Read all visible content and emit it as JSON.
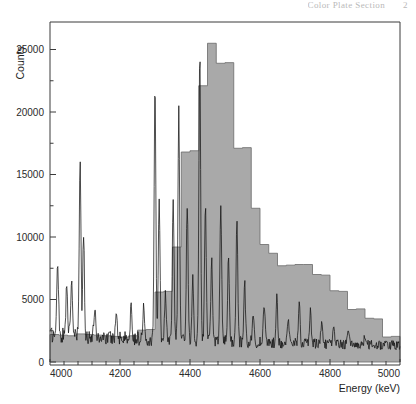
{
  "header": {
    "running_head": "Color Plate Section",
    "page_number": "2"
  },
  "chart_data": {
    "type": "line",
    "title": "",
    "subtitle": "",
    "xlabel": "Energy (keV)",
    "ylabel": "Counts",
    "xlim": [
      4000,
      5000
    ],
    "ylim": [
      0,
      27200
    ],
    "grid": false,
    "legend": null,
    "x_ticks": [
      4000,
      4200,
      4400,
      4600,
      4800,
      5000
    ],
    "x_tick_labels": [
      "4000",
      "4200",
      "4400",
      "4600",
      "4800",
      "5000"
    ],
    "x_minor_tick_step": 40,
    "y_ticks": [
      0,
      5000,
      10000,
      15000,
      20000,
      25000
    ],
    "y_tick_labels": [
      "0",
      "5000",
      "10000",
      "15000",
      "20000",
      "25000"
    ],
    "y_minor_tick_step": 2500,
    "colors": {
      "histogram_fill": "#a9a9a9",
      "histogram_edge": "#6a6a6a",
      "spectrum_line": "#141414",
      "axis": "#3a3a3a"
    },
    "series": [
      {
        "name": "Gated yield (filled histogram)",
        "type": "step",
        "bin_width": 25,
        "bin_edges": [
          4000,
          4025,
          4050,
          4075,
          4100,
          4125,
          4150,
          4175,
          4200,
          4225,
          4250,
          4275,
          4300,
          4325,
          4350,
          4375,
          4400,
          4425,
          4450,
          4475,
          4500,
          4525,
          4550,
          4575,
          4600,
          4625,
          4650,
          4675,
          4700,
          4725,
          4750,
          4775,
          4800,
          4825,
          4850,
          4875,
          4900,
          4925,
          4950,
          4975,
          5000
        ],
        "values": [
          2200,
          2150,
          2100,
          2250,
          2200,
          2150,
          2100,
          2050,
          2000,
          2100,
          2550,
          2600,
          5600,
          5650,
          9200,
          16800,
          16900,
          22100,
          25500,
          23900,
          23950,
          17100,
          17150,
          12300,
          9400,
          8700,
          7700,
          7750,
          7800,
          7800,
          7000,
          6950,
          5700,
          5650,
          4200,
          4250,
          3500,
          3450,
          2000,
          2050
        ]
      },
      {
        "name": "Total spectrum (overlaid line)",
        "type": "line",
        "description": "noisy continuum near 1500-2500 counts with sharp discrete peaks",
        "peaks": [
          {
            "energy": 4022,
            "height": 7700
          },
          {
            "energy": 4048,
            "height": 6100
          },
          {
            "energy": 4062,
            "height": 5900
          },
          {
            "energy": 4086,
            "height": 15700
          },
          {
            "energy": 4096,
            "height": 9500
          },
          {
            "energy": 4128,
            "height": 4100
          },
          {
            "energy": 4190,
            "height": 3900
          },
          {
            "energy": 4232,
            "height": 4200
          },
          {
            "energy": 4268,
            "height": 4400
          },
          {
            "energy": 4300,
            "height": 21900
          },
          {
            "energy": 4312,
            "height": 12800
          },
          {
            "energy": 4330,
            "height": 5400
          },
          {
            "energy": 4352,
            "height": 13000
          },
          {
            "energy": 4368,
            "height": 20100
          },
          {
            "energy": 4392,
            "height": 12600
          },
          {
            "energy": 4408,
            "height": 6500
          },
          {
            "energy": 4428,
            "height": 24800
          },
          {
            "energy": 4444,
            "height": 12500
          },
          {
            "energy": 4462,
            "height": 8300
          },
          {
            "energy": 4488,
            "height": 12800
          },
          {
            "energy": 4510,
            "height": 8200
          },
          {
            "energy": 4534,
            "height": 11200
          },
          {
            "energy": 4556,
            "height": 6400
          },
          {
            "energy": 4580,
            "height": 3900
          },
          {
            "energy": 4612,
            "height": 4600
          },
          {
            "energy": 4648,
            "height": 5300
          },
          {
            "energy": 4680,
            "height": 3600
          },
          {
            "energy": 4712,
            "height": 5000
          },
          {
            "energy": 4744,
            "height": 4200
          },
          {
            "energy": 4776,
            "height": 3400
          },
          {
            "energy": 4810,
            "height": 2900
          },
          {
            "energy": 4852,
            "height": 2600
          },
          {
            "energy": 4900,
            "height": 2300
          },
          {
            "energy": 4960,
            "height": 2100
          }
        ],
        "baseline": 1600
      }
    ]
  }
}
